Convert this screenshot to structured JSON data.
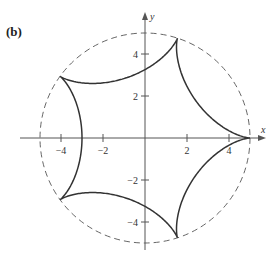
{
  "panel_label": "(b)",
  "axes": {
    "x_label": "x",
    "y_label": "y",
    "origin_px": [
      145,
      138
    ],
    "scale_px_per_unit": 21,
    "x_ticks": [
      {
        "value": -4,
        "label": "−4"
      },
      {
        "value": -2,
        "label": "−2"
      },
      {
        "value": 2,
        "label": "2"
      },
      {
        "value": 4,
        "label": "4"
      }
    ],
    "y_ticks": [
      {
        "value": 4,
        "label": "4"
      },
      {
        "value": 2,
        "label": "2"
      },
      {
        "value": -2,
        "label": "−2"
      },
      {
        "value": -4,
        "label": "−4"
      }
    ],
    "axis_color": "#555555"
  },
  "circle": {
    "radius": 5,
    "style": "dashed",
    "color": "#555555"
  },
  "curve": {
    "name": "hypocycloid",
    "cusps": 5,
    "fixed_radius": 5,
    "rolling_radius": 1,
    "parametric_x": "4cos(t) + cos(4t)",
    "parametric_y": "4sin(t) - sin(4t)",
    "color": "#333333"
  }
}
